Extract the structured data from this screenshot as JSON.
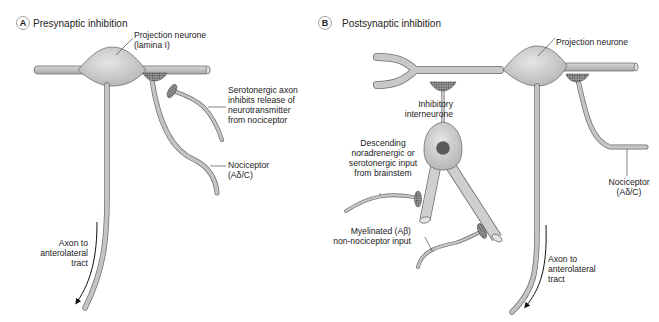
{
  "panel_a": {
    "badge": "A",
    "title": "Presynaptic inhibition",
    "labels": {
      "projection_neurone_1": "Projection neurone",
      "projection_neurone_2": "(lamina I)",
      "serotonergic_1": "Serotonergic axon",
      "serotonergic_2": "inhibits release of",
      "serotonergic_3": "neurotransmitter",
      "serotonergic_4": "from nociceptor",
      "nociceptor_1": "Nociceptor",
      "nociceptor_2": "(Aδ/C)",
      "axon_1": "Axon to",
      "axon_2": "anterolateral",
      "axon_3": "tract"
    }
  },
  "panel_b": {
    "badge": "B",
    "title": "Postsynaptic inhibition",
    "labels": {
      "projection_neurone": "Projection neurone",
      "inhibitory_1": "Inhibitory",
      "inhibitory_2": "interneurone",
      "descending_1": "Descending",
      "descending_2": "noradrenergic or",
      "descending_3": "serotonergic input",
      "descending_4": "from brainstem",
      "myelinated_1": "Myelinated (Aβ)",
      "myelinated_2": "non-nociceptor input",
      "nociceptor_1": "Nociceptor",
      "nociceptor_2": "(Aδ/C)",
      "axon_1": "Axon to",
      "axon_2": "anterolateral",
      "axon_3": "tract"
    }
  },
  "colors": {
    "neuron_fill": "#c4c4c4",
    "neuron_stroke": "#6e6e6e",
    "soma_fill": "#d6d6d6",
    "nucleus": "#5a5a5a",
    "synapse": "#8a8a8a",
    "text": "#222222"
  }
}
